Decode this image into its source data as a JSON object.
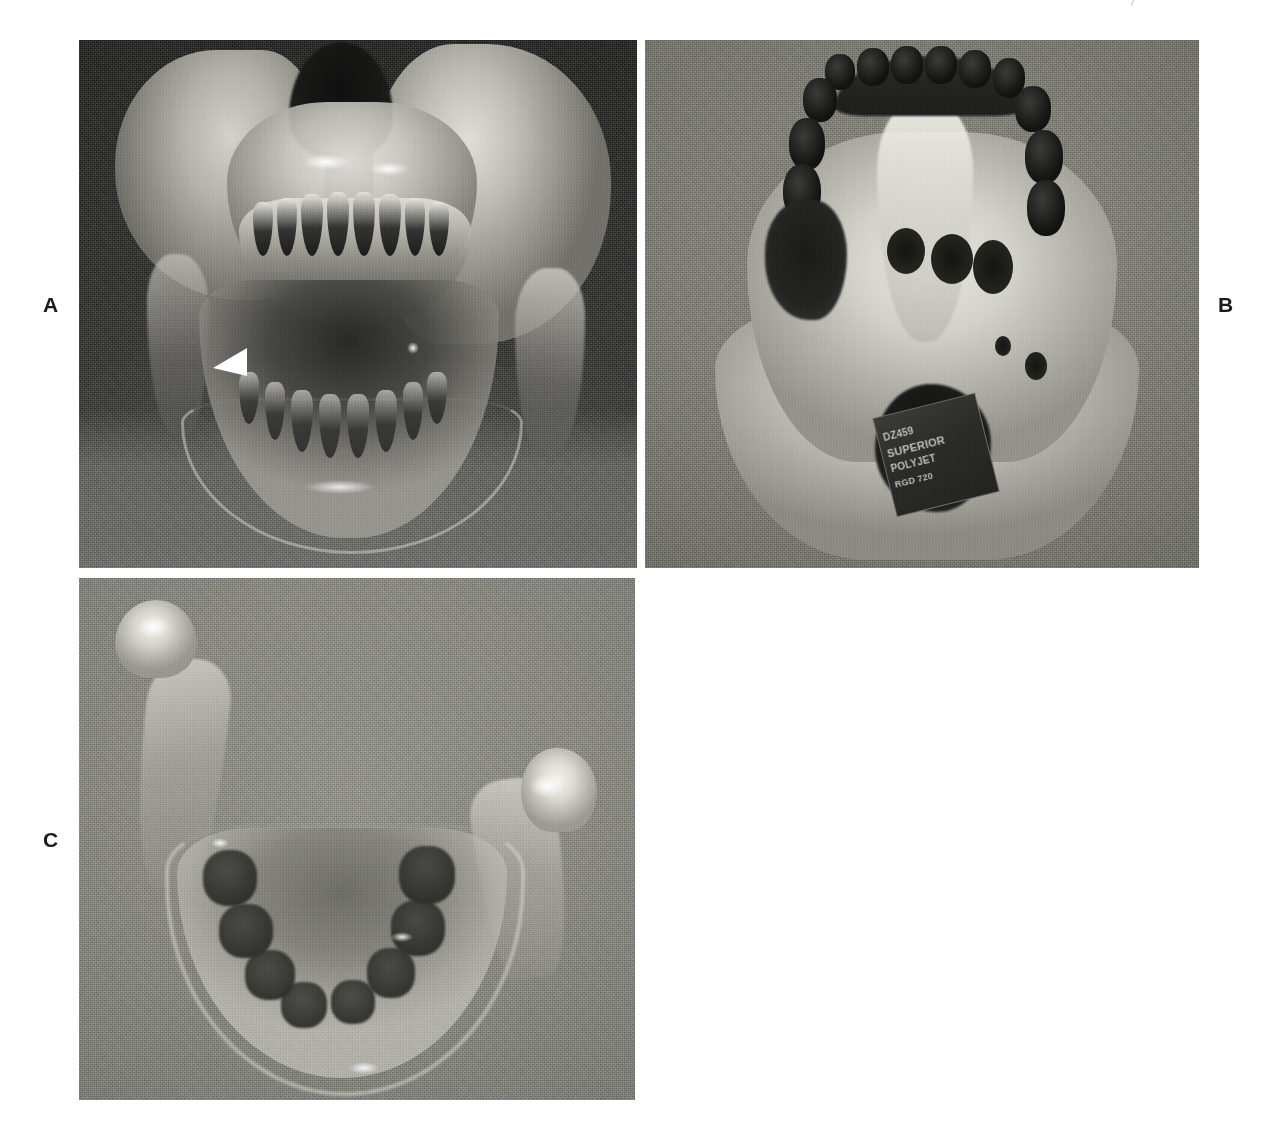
{
  "figure": {
    "type": "photographic-figure",
    "panel_count": 3,
    "running_head": "",
    "background_color": "#ffffff"
  },
  "labels": {
    "a": "A",
    "b": "B",
    "c": "C"
  },
  "panels": [
    {
      "id": "A",
      "label": "A",
      "label_position": "left",
      "caption_text": "Frontal (anterior) view of the transparent 3D-printed maxillofacial model",
      "background_color": "#2b2b2b",
      "background_description": "dark cloth backdrop with lighter table surface at bottom",
      "subject": "3D-printed translucent skull model showing maxilla, dentition and mandible",
      "marker": {
        "type": "arrowhead",
        "color": "#ffffff",
        "direction": "left",
        "description": "white arrowhead indicating lesion site on left mandibular region"
      },
      "bounds": {
        "x": 79,
        "y": 40,
        "width": 558,
        "height": 528
      }
    },
    {
      "id": "B",
      "label": "B",
      "label_position": "right",
      "caption_text": "Inferior (basal) view of the transparent 3D-printed maxillofacial model",
      "background_color": "#77776f",
      "background_description": "grey woven fabric backdrop",
      "subject": "3D-printed translucent skull base showing palate, dental arch, orbits and foramen magnum",
      "sticker": {
        "present": true,
        "description": "dark printed service label adhered inside the foramen magnum",
        "lines": [
          "DZ459",
          "SUPERIOR",
          "POLYJET",
          "RGD 720"
        ],
        "legible": false
      },
      "bounds": {
        "x": 645,
        "y": 40,
        "width": 554,
        "height": 528
      }
    },
    {
      "id": "C",
      "label": "C",
      "label_position": "left",
      "caption_text": "Superior (occlusal) view of the transparent 3D-printed mandible",
      "background_color": "#8a8a83",
      "background_description": "grey woven fabric backdrop",
      "subject": "3D-printed translucent mandible showing condyle, coronoid process, rami and dental arch",
      "marker": {
        "type": "none"
      },
      "bounds": {
        "x": 79,
        "y": 578,
        "width": 556,
        "height": 522
      }
    }
  ],
  "colors": {
    "page_background": "#ffffff",
    "label_text": "#1a1a1a",
    "panel_a_backdrop": "#1e1e1d",
    "panel_b_backdrop": "#7d7d74",
    "panel_c_backdrop": "#8b8b83",
    "model_material": "#d2d1c9",
    "marker_arrow": "#ffffff"
  }
}
